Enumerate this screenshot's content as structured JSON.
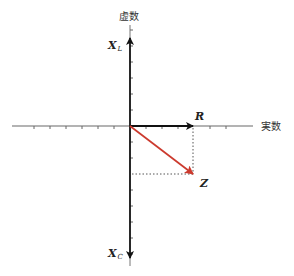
{
  "diagram": {
    "axes": {
      "imaginary_label": "虚数",
      "real_label": "実数"
    },
    "vectors": [
      {
        "id": "R",
        "label": "R",
        "color": "#111111",
        "from": [
          0,
          0
        ],
        "to": [
          4,
          0
        ]
      },
      {
        "id": "Z",
        "label": "Z",
        "color": "#cc3a2e",
        "from": [
          0,
          0
        ],
        "to": [
          4,
          -3
        ]
      },
      {
        "id": "XL",
        "label": "X",
        "subscript": "L",
        "color": "#111111",
        "direction": "up"
      },
      {
        "id": "XC",
        "label": "X",
        "subscript": "C",
        "color": "#111111",
        "direction": "down"
      }
    ],
    "labels": {
      "xl_main": "X",
      "xl_sub": "L",
      "xc_main": "X",
      "xc_sub": "C",
      "r": "R",
      "z": "Z"
    },
    "colors": {
      "axis": "#999999",
      "vector": "#111111",
      "impedance": "#cc3a2e",
      "guide": "#555555"
    }
  }
}
